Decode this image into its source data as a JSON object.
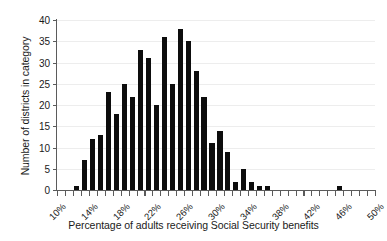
{
  "chart_data": {
    "type": "bar",
    "title": "",
    "xlabel": "Percentage of adults receiving Social Security benefits",
    "ylabel": "Number of districts in category",
    "grid": true,
    "legend": false,
    "xlim": [
      10,
      50
    ],
    "ylim": [
      0,
      40
    ],
    "xtick_step": 1,
    "xlabel_step": 4,
    "ytick_step": 5,
    "bar_width_pct": 0.65,
    "xtick_labels": [
      "10%",
      "14%",
      "18%",
      "22%",
      "26%",
      "30%",
      "34%",
      "38%",
      "42%",
      "46%",
      "50%"
    ],
    "ytick_labels": [
      "0",
      "5",
      "10",
      "15",
      "20",
      "25",
      "30",
      "35",
      "40"
    ],
    "bar_color": "#0d0d0d",
    "axis_color": "#5b5b5b",
    "grid_color": "#ededed",
    "categories": [
      "10%",
      "11%",
      "12%",
      "13%",
      "14%",
      "15%",
      "16%",
      "17%",
      "18%",
      "19%",
      "20%",
      "21%",
      "22%",
      "23%",
      "24%",
      "25%",
      "26%",
      "27%",
      "28%",
      "29%",
      "30%",
      "31%",
      "32%",
      "33%",
      "34%",
      "35%",
      "36%",
      "37%",
      "38%",
      "39%",
      "40%",
      "41%",
      "42%",
      "43%",
      "44%",
      "45%",
      "46%",
      "47%",
      "48%",
      "49%"
    ],
    "values": [
      0,
      0,
      1,
      7,
      12,
      13,
      23,
      18,
      25,
      22,
      33,
      31,
      20,
      36,
      25,
      38,
      35,
      28,
      22,
      11,
      14,
      9,
      2,
      5,
      2,
      1,
      1,
      0,
      0,
      0,
      0,
      0,
      0,
      0,
      0,
      1,
      0,
      0,
      0,
      0
    ]
  }
}
